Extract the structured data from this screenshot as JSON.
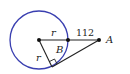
{
  "diagram": {
    "colors": {
      "circle": "#3a3fb0",
      "lines": "#222222",
      "background": "#ffffff"
    },
    "labels": {
      "radius_top": "r",
      "distance": "112",
      "point_a": "A",
      "angle_b": "B",
      "radius_slant": "r"
    }
  }
}
